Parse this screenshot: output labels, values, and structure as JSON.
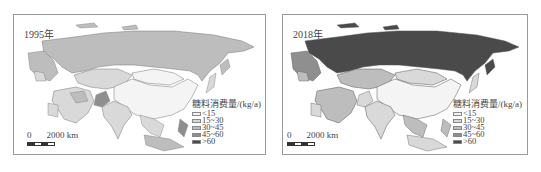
{
  "figure": {
    "panels": [
      {
        "year_label": "1995年",
        "legend": {
          "title": "糖料消费量/(kg/a)",
          "classes": [
            {
              "label": "<15",
              "color": "#f4f4f4"
            },
            {
              "label": "15~30",
              "color": "#d9d9d9"
            },
            {
              "label": "30~45",
              "color": "#bdbdbd"
            },
            {
              "label": "45~60",
              "color": "#8f8f8f"
            },
            {
              "label": ">60",
              "color": "#4a4a4a"
            }
          ]
        },
        "scale_bar": {
          "start": "0",
          "end": "2000 km"
        }
      },
      {
        "year_label": "2018年",
        "legend": {
          "title": "糖料消费量/(kg/a)",
          "classes": [
            {
              "label": "<15",
              "color": "#f4f4f4"
            },
            {
              "label": "15~30",
              "color": "#d9d9d9"
            },
            {
              "label": "30~45",
              "color": "#bdbdbd"
            },
            {
              "label": "45~60",
              "color": "#8f8f8f"
            },
            {
              "label": ">60",
              "color": "#4a4a4a"
            }
          ]
        },
        "scale_bar": {
          "start": "0",
          "end": "2000 km"
        }
      }
    ]
  },
  "map_data": {
    "1995": {
      "Russia": "30~45",
      "Central Asia/Kazakhstan": "15~30",
      "Mongolia": "<15",
      "China": "<15",
      "India": "15~30",
      "Pakistan": "45~60",
      "Middle East": "15~30",
      "Southeast Asia": "15~30",
      "Europe west edge": "30~45"
    },
    "2018": {
      "Russia": ">60",
      "Central Asia/Kazakhstan": "30~45",
      "Mongolia": "15~30",
      "China": "<15",
      "India": "15~30",
      "Middle East": "30~45",
      "Southeast Asia": "30~45",
      "Europe west edge": "30~45"
    }
  }
}
